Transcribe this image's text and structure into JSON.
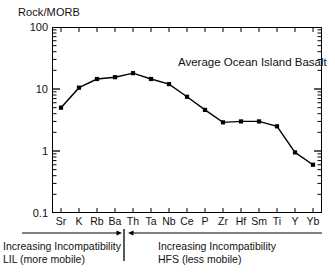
{
  "chart_data": {
    "type": "line",
    "title": "",
    "annotation": "Average Ocean Island Basalt",
    "ylabel": "Rock/MORB",
    "xlabel": "",
    "yscale": "log",
    "ylim": [
      0.1,
      100
    ],
    "ytick_labels": [
      "100",
      "10",
      "1",
      "0.1"
    ],
    "ytick_values": [
      100,
      10,
      1,
      0.1
    ],
    "grid": false,
    "legend": "none",
    "marker": "filled-square",
    "line_color": "#000000",
    "categories": [
      "Sr",
      "K",
      "Rb",
      "Ba",
      "Th",
      "Ta",
      "Nb",
      "Ce",
      "P",
      "Zr",
      "Hf",
      "Sm",
      "Ti",
      "Y",
      "Yb"
    ],
    "values": [
      5.0,
      10.5,
      14.5,
      15.5,
      18.0,
      14.5,
      12.0,
      7.5,
      4.6,
      2.9,
      3.0,
      3.0,
      2.5,
      0.95,
      0.6
    ],
    "series": [
      {
        "name": "Average Ocean Island Basalt",
        "values": [
          5.0,
          10.5,
          14.5,
          15.5,
          18.0,
          14.5,
          12.0,
          7.5,
          4.6,
          2.9,
          3.0,
          3.0,
          2.5,
          0.95,
          0.6
        ]
      }
    ],
    "annotations": {
      "left_group": {
        "line1": "Increasing Incompatibility",
        "line2": "LIL (more mobile)",
        "arrow_direction": "right",
        "spans_categories": [
          "Sr",
          "K",
          "Rb",
          "Ba"
        ]
      },
      "right_group": {
        "line1": "Increasing Incompatibility",
        "line2": "HFS (less mobile)",
        "arrow_direction": "left",
        "spans_categories": [
          "Th",
          "Ta",
          "Nb",
          "Ce",
          "P",
          "Zr",
          "Hf",
          "Sm",
          "Ti",
          "Y",
          "Yb"
        ]
      },
      "divider_after_category": "Ba"
    }
  },
  "colors": {
    "axis": "#000000",
    "line": "#000000",
    "marker": "#000000",
    "text": "#111111",
    "background": "#ffffff"
  }
}
